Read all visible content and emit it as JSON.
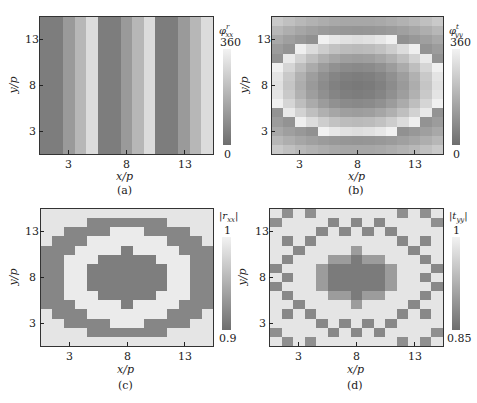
{
  "header_fragment": "",
  "chart_data": [
    {
      "id": "a",
      "type": "heatmap",
      "caption": "(a)",
      "xlabel": "x/p",
      "ylabel": "y/p",
      "xticks": [
        3,
        8,
        13
      ],
      "yticks": [
        3,
        8,
        13
      ],
      "grid_size": [
        15,
        15
      ],
      "colorbar": {
        "title": "φ^r_xx",
        "max_label": "360",
        "min_label": "0",
        "range": [
          0,
          360
        ]
      },
      "description": "Vertical stripes: 3 repeating bands of 5 columns each, phase increasing left to right within each band",
      "column_values": [
        40,
        40,
        120,
        200,
        300,
        40,
        40,
        120,
        200,
        300,
        40,
        40,
        120,
        200,
        300
      ]
    },
    {
      "id": "b",
      "type": "heatmap",
      "caption": "(b)",
      "xlabel": "x/p",
      "ylabel": "y/p",
      "xticks": [
        3,
        8,
        13
      ],
      "yticks": [
        3,
        8,
        13
      ],
      "grid_size": [
        15,
        15
      ],
      "colorbar": {
        "title": "φ^t_yy",
        "max_label": "360",
        "min_label": "0",
        "range": [
          0,
          360
        ]
      },
      "description": "Radially symmetric phase profile: dark center, bright elliptical ring, darker corners"
    },
    {
      "id": "c",
      "type": "heatmap",
      "caption": "(c)",
      "xlabel": "x/p",
      "ylabel": "y/p",
      "xticks": [
        3,
        8,
        13
      ],
      "yticks": [
        3,
        8,
        13
      ],
      "grid_size": [
        15,
        15
      ],
      "colorbar": {
        "title": "|r_xx|",
        "max_label": "1",
        "min_label": "0.9",
        "range": [
          0.9,
          1.0
        ]
      },
      "description": "Concentric rings: dark central disk, bright ring, dark ring, bright corners"
    },
    {
      "id": "d",
      "type": "heatmap",
      "caption": "(d)",
      "xlabel": "x/p",
      "ylabel": "y/p",
      "xticks": [
        3,
        8,
        13
      ],
      "yticks": [
        3,
        8,
        13
      ],
      "grid_size": [
        15,
        15
      ],
      "colorbar": {
        "title": "|t_yy|",
        "max_label": "1",
        "min_label": "0.85",
        "range": [
          0.85,
          1.0
        ]
      },
      "description": "Mostly bright with dark central disk and scattered dark checkerboard-like cells along rings"
    }
  ],
  "panels": {
    "a": {
      "caption": "(a)",
      "xlabel": "x/p",
      "ylabel": "y/p",
      "cb_title": "φ",
      "cb_sup": "r",
      "cb_sub": "xx",
      "cb_max": "360",
      "cb_min": "0"
    },
    "b": {
      "caption": "(b)",
      "xlabel": "x/p",
      "ylabel": "y/p",
      "cb_title": "φ",
      "cb_sup": "t",
      "cb_sub": "yy",
      "cb_max": "360",
      "cb_min": "0"
    },
    "c": {
      "caption": "(c)",
      "xlabel": "x/p",
      "ylabel": "y/p",
      "cb_title": "|r",
      "cb_sub": "xx",
      "cb_close": "|",
      "cb_max": "1",
      "cb_min": "0.9"
    },
    "d": {
      "caption": "(d)",
      "xlabel": "x/p",
      "ylabel": "y/p",
      "cb_title": "|t",
      "cb_sub": "yy",
      "cb_close": "|",
      "cb_max": "1",
      "cb_min": "0.85"
    }
  },
  "ticks": {
    "t3": "3",
    "t8": "8",
    "t13": "13"
  }
}
